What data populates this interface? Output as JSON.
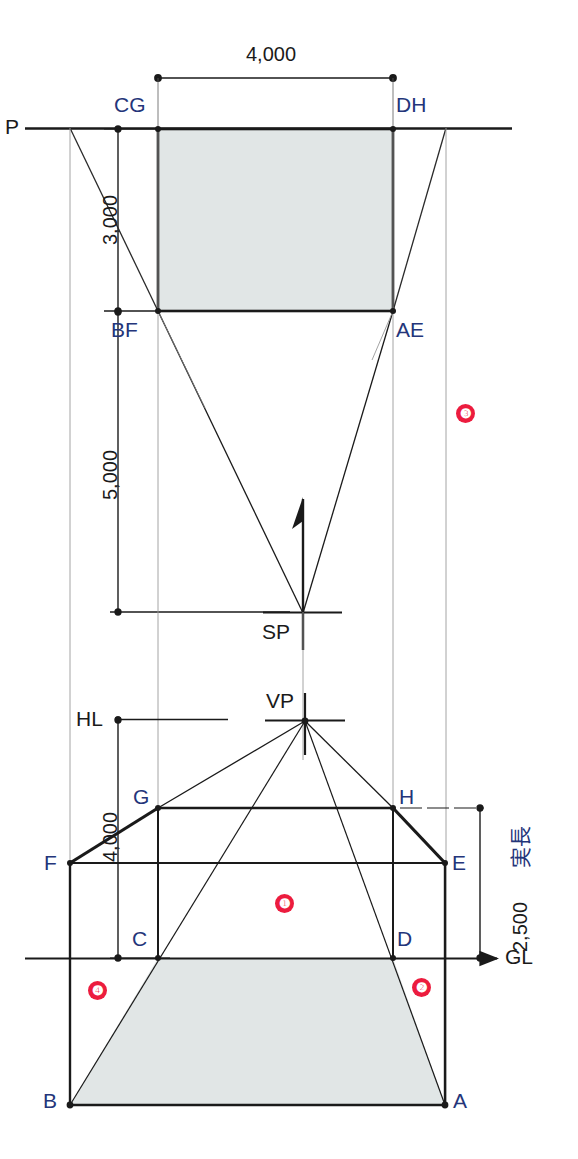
{
  "diagram": {
    "colors": {
      "line": "#1a1a1a",
      "thin_line": "#555555",
      "fill_gray": "#e1e6e6",
      "label_blue": "#24357a",
      "marker_red": "#ec1c3e"
    }
  },
  "dimensions": [
    {
      "id": "dim-width-4000",
      "value": "4,000",
      "orientation": "horizontal"
    },
    {
      "id": "dim-depth-3000",
      "value": "3,000",
      "orientation": "vertical"
    },
    {
      "id": "dim-distance-5000",
      "value": "5,000",
      "orientation": "vertical"
    },
    {
      "id": "dim-height-4000",
      "value": "4,000",
      "orientation": "vertical"
    },
    {
      "id": "dim-height-2500",
      "value": "2,500",
      "orientation": "vertical"
    }
  ],
  "reference_lines": [
    {
      "id": "picture-plane",
      "label": "P"
    },
    {
      "id": "horizon-line",
      "label": "HL"
    },
    {
      "id": "ground-line",
      "label": "GL"
    }
  ],
  "key_points": [
    {
      "id": "point-cg",
      "label": "CG"
    },
    {
      "id": "point-dh",
      "label": "DH"
    },
    {
      "id": "point-bf",
      "label": "BF"
    },
    {
      "id": "point-ae",
      "label": "AE"
    },
    {
      "id": "point-sp",
      "label": "SP"
    },
    {
      "id": "point-vp",
      "label": "VP"
    },
    {
      "id": "point-g",
      "label": "G"
    },
    {
      "id": "point-h",
      "label": "H"
    },
    {
      "id": "point-f",
      "label": "F"
    },
    {
      "id": "point-e",
      "label": "E"
    },
    {
      "id": "point-c",
      "label": "C"
    },
    {
      "id": "point-d",
      "label": "D"
    },
    {
      "id": "point-b",
      "label": "B"
    },
    {
      "id": "point-a",
      "label": "A"
    }
  ],
  "annotations": {
    "true_length": "実長"
  },
  "step_markers": [
    {
      "id": "step-1",
      "label": "❶"
    },
    {
      "id": "step-2",
      "label": "❷"
    },
    {
      "id": "step-3",
      "label": "❸"
    },
    {
      "id": "step-4",
      "label": "❹"
    }
  ],
  "labels": {
    "p": "P",
    "cg": "CG",
    "dh": "DH",
    "bf": "BF",
    "ae": "AE",
    "sp": "SP",
    "vp": "VP",
    "hl": "HL",
    "gl": "GL",
    "g": "G",
    "h": "H",
    "f": "F",
    "e": "E",
    "c": "C",
    "d": "D",
    "b": "B",
    "a": "A",
    "d4000_top": "4,000",
    "d3000": "3,000",
    "d5000": "5,000",
    "d4000_side": "4,000",
    "d2500": "2,500",
    "jitsucho": "実長",
    "m1": "❶",
    "m2": "❷",
    "m3": "❸",
    "m4": "❹"
  }
}
